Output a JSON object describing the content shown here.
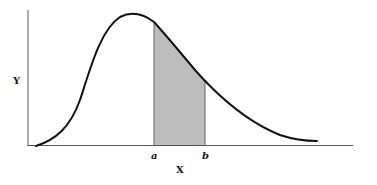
{
  "diagram": {
    "title": "",
    "type": "probability density curve with shaded area between a and b",
    "axis_labels": {
      "x": "X",
      "y": "Y"
    },
    "interval_labels": {
      "lower": "a",
      "upper": "b"
    },
    "colors": {
      "curve": "#111111",
      "axes": "#555555",
      "shade": "#bdbdbd",
      "background": "#ffffff"
    }
  }
}
